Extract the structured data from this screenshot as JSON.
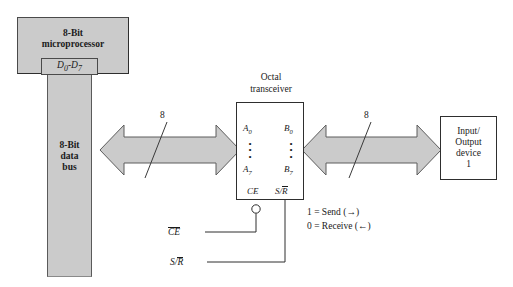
{
  "microprocessor": {
    "line1": "8-Bit",
    "line2": "microprocessor",
    "data_port": "D0-D7",
    "data_port_prefix": "D",
    "data_port_sub1": "0",
    "data_port_dash": "-",
    "data_port_letter2": "D",
    "data_port_sub2": "7"
  },
  "data_bus": {
    "line1": "8-Bit",
    "line2": "data",
    "line3": "bus"
  },
  "transceiver": {
    "title_line1": "Octal",
    "title_line2": "transceiver",
    "pin_a_top": "A",
    "pin_a_top_sub": "0",
    "pin_a_bottom": "A",
    "pin_a_bottom_sub": "7",
    "pin_b_top": "B",
    "pin_b_top_sub": "0",
    "pin_b_bottom": "B",
    "pin_b_bottom_sub": "7",
    "ellipsis": "•",
    "ctrl_ce": "CE",
    "ctrl_sr_s": "S/",
    "ctrl_sr_r": "R"
  },
  "io_device": {
    "line1": "Input/",
    "line2": "Output",
    "line3": "device",
    "line4": "1"
  },
  "legend": {
    "send": "1 = Send (→)",
    "receive": "0 = Receive (←)"
  },
  "control_inputs": {
    "ce_label": "CE",
    "sr_label_s": "S/",
    "sr_label_r": "R"
  },
  "bus_widths": {
    "left_bus": "8",
    "right_bus": "8"
  },
  "colors": {
    "block_fill": "#cbcbcb",
    "arrow_fill": "#cbcbcb",
    "line": "#2e2e2e",
    "background": "#ffffff"
  }
}
